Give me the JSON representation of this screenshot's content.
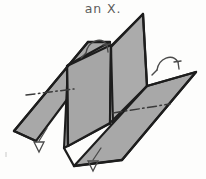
{
  "figure": {
    "caption": "an X.",
    "kind": "hand-drawn-technical-sketch",
    "background_color": "#fdfdfc",
    "panel_fill_color": "#a8a8a8",
    "panel_fill_color_alt": "#a2a2a2",
    "outline_color": "#1d1d1d",
    "fold_line_color": "#3a3a3a",
    "annotation_color": "#4a4a4a",
    "caption_color": "#5d5d5d",
    "panels": [
      {
        "name": "left-flange",
        "label": "left flange panel",
        "fill": "#a8a8a8",
        "points": "14,131 88,42 110,42 36,141"
      },
      {
        "name": "left-web",
        "label": "left rising web panel",
        "fill": "#a3a3a3",
        "points": "64,148 68,65 110,42 109,124"
      },
      {
        "name": "center-fin",
        "label": "center vertical fin",
        "fill": "#a6a6a6",
        "points": "67,66 111,45 110,123 68,146"
      },
      {
        "name": "right-web",
        "label": "right rising web panel",
        "fill": "#ababab",
        "points": "111,47 143,14 147,86 113,123"
      },
      {
        "name": "right-flange",
        "label": "right flange panel",
        "fill": "#a8a8a8",
        "points": "74,166 147,86 196,72 122,160"
      }
    ],
    "fold_lines": [
      {
        "name": "left-flange-fold",
        "label": "fold centerline on left flange",
        "x1": 26,
        "y1": 95,
        "x2": 74,
        "y2": 89
      },
      {
        "name": "right-flange-fold",
        "label": "fold centerline on right flange",
        "x1": 113,
        "y1": 113,
        "x2": 170,
        "y2": 104
      }
    ],
    "annotations": [
      {
        "name": "upper-left-hook-arrow",
        "label": "curved hook arrow, upper left edge",
        "type": "hook-arrow",
        "x": 98,
        "y": 46
      },
      {
        "name": "upper-right-hook-arrow",
        "label": "curved hook arrow, upper right edge",
        "type": "hook-arrow",
        "x": 168,
        "y": 62
      },
      {
        "name": "lower-left-open-arrow",
        "label": "open arrowhead leader, lower left edge",
        "type": "open-arrow",
        "x": 41,
        "y": 141
      },
      {
        "name": "lower-center-open-arrow",
        "label": "open arrowhead leader, lower center edge",
        "type": "open-arrow",
        "x": 95,
        "y": 160
      }
    ],
    "artifacts": [
      {
        "name": "scan-speck",
        "label": "faint scan speck, lower left",
        "x": 5,
        "y": 152
      }
    ]
  }
}
